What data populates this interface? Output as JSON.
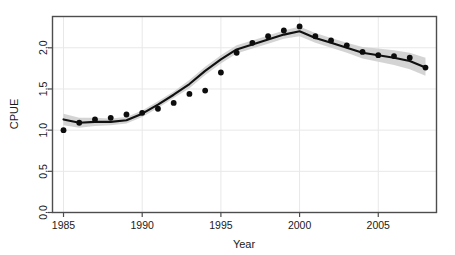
{
  "figure": {
    "background_color": "#ffffff",
    "frame_color": "#4d4d4d",
    "grid_color": "#e8e8e8",
    "line_color": "#111111",
    "band_color": "#cccccc",
    "point_color": "#0d0d0d"
  },
  "axes": {
    "x_title": "Year",
    "y_title": "CPUE",
    "x_ticks": [
      "1985",
      "1990",
      "1995",
      "2000",
      "2005"
    ],
    "y_ticks": [
      "0,0",
      "0,5",
      "1,0",
      "1,5",
      "2,0"
    ]
  },
  "chart_data": {
    "type": "line",
    "title": "",
    "xlabel": "Year",
    "ylabel": "CPUE",
    "xlim": [
      1984.3,
      2008.7
    ],
    "ylim": [
      0.0,
      2.38
    ],
    "grid": true,
    "legend": "none",
    "x": [
      1985,
      1986,
      1987,
      1988,
      1989,
      1990,
      1991,
      1992,
      1993,
      1994,
      1995,
      1996,
      1997,
      1998,
      1999,
      2000,
      2001,
      2002,
      2003,
      2004,
      2005,
      2006,
      2007,
      2008
    ],
    "series": [
      {
        "name": "Observed CPUE",
        "type": "scatter",
        "marker": "filled-circle",
        "values": [
          1.0,
          1.09,
          1.13,
          1.15,
          1.19,
          1.21,
          1.26,
          1.33,
          1.44,
          1.48,
          1.7,
          1.94,
          2.06,
          2.14,
          2.21,
          2.26,
          2.14,
          2.09,
          2.03,
          1.95,
          1.91,
          1.9,
          1.88,
          1.76
        ]
      },
      {
        "name": "Fitted trend",
        "type": "line",
        "values": [
          1.13,
          1.09,
          1.1,
          1.1,
          1.12,
          1.2,
          1.31,
          1.43,
          1.56,
          1.72,
          1.86,
          1.98,
          2.04,
          2.1,
          2.16,
          2.2,
          2.12,
          2.06,
          2.0,
          1.94,
          1.91,
          1.88,
          1.84,
          1.76
        ]
      },
      {
        "name": "Confidence band upper",
        "type": "band-upper",
        "values": [
          1.2,
          1.15,
          1.15,
          1.14,
          1.16,
          1.24,
          1.35,
          1.47,
          1.61,
          1.77,
          1.91,
          2.03,
          2.09,
          2.15,
          2.21,
          2.26,
          2.18,
          2.12,
          2.06,
          2.01,
          1.99,
          1.97,
          1.94,
          1.88
        ]
      },
      {
        "name": "Confidence band lower",
        "type": "band-lower",
        "values": [
          1.06,
          1.03,
          1.05,
          1.06,
          1.08,
          1.16,
          1.27,
          1.39,
          1.51,
          1.67,
          1.81,
          1.93,
          1.99,
          2.05,
          2.11,
          2.14,
          2.06,
          2.0,
          1.94,
          1.87,
          1.83,
          1.79,
          1.74,
          1.66
        ]
      }
    ]
  }
}
